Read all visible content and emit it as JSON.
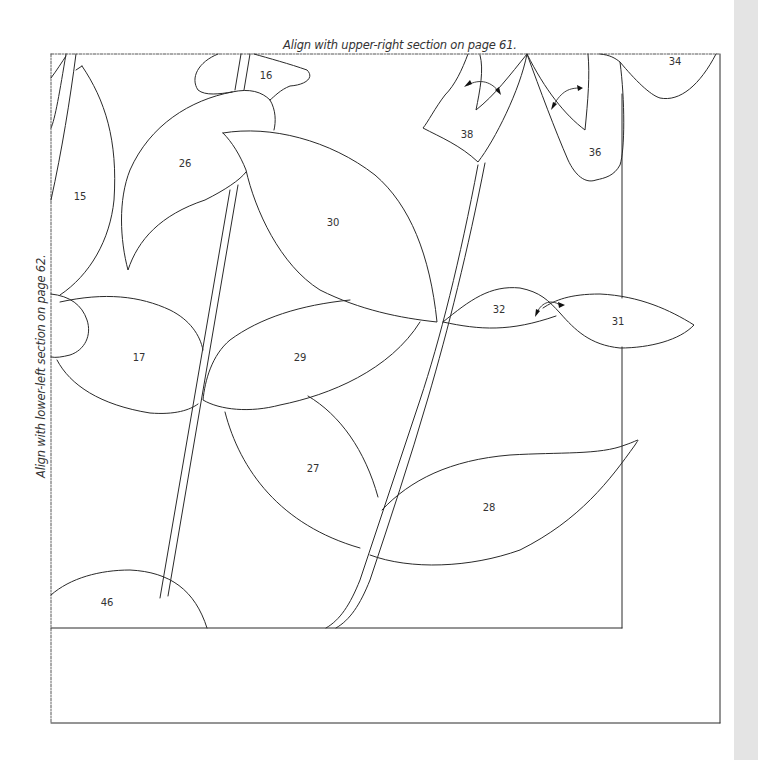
{
  "captions": {
    "top": "Align with upper-right section on page 61.",
    "left": "Align with lower-left section on page 62."
  },
  "pieces": [
    {
      "id": "16",
      "x": 266,
      "y": 75
    },
    {
      "id": "34",
      "x": 675,
      "y": 61
    },
    {
      "id": "26",
      "x": 185,
      "y": 163
    },
    {
      "id": "15",
      "x": 80,
      "y": 196
    },
    {
      "id": "30",
      "x": 333,
      "y": 222
    },
    {
      "id": "38",
      "x": 467,
      "y": 134
    },
    {
      "id": "36",
      "x": 595,
      "y": 152
    },
    {
      "id": "32",
      "x": 499,
      "y": 309
    },
    {
      "id": "31",
      "x": 618,
      "y": 321
    },
    {
      "id": "17",
      "x": 139,
      "y": 357
    },
    {
      "id": "29",
      "x": 300,
      "y": 357
    },
    {
      "id": "27",
      "x": 313,
      "y": 468
    },
    {
      "id": "28",
      "x": 489,
      "y": 507
    },
    {
      "id": "46",
      "x": 107,
      "y": 602
    }
  ],
  "colors": {
    "line": "#2a2a2a",
    "gutter": "#e4e4e4",
    "caption": "#333333"
  }
}
